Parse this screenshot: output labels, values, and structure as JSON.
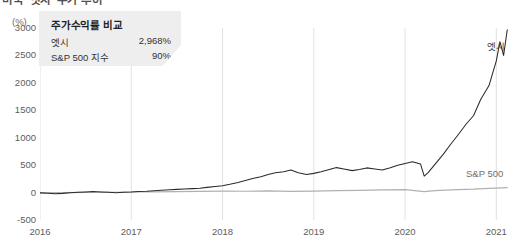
{
  "headline": "미국 ‘엣시’ 주가 추이",
  "axis_unit": "(%)",
  "callout": {
    "title": "주가수익률 비교",
    "rows": [
      {
        "name": "엣시",
        "value": "2,968%"
      },
      {
        "name": "S&P 500 지수",
        "value": "90%"
      }
    ]
  },
  "series_labels": {
    "etsy": "엣시",
    "sp500": "S&P 500"
  },
  "colors": {
    "etsy_line": "#2b2b2b",
    "sp500_line": "#b0b0b0",
    "callout_bg": "#eeeeee",
    "gridline": "#e2e2e2",
    "tick_text": "#5d5d5d"
  },
  "chart_data": {
    "type": "line",
    "title": "미국 ‘엣시’ 주가 추이",
    "subtitle": "주가수익률 비교",
    "xlabel": "",
    "ylabel": "(%)",
    "ylim": [
      -500,
      3000
    ],
    "ytick_labels": [
      "3000",
      "2500",
      "2000",
      "1500",
      "1000",
      "500",
      "0",
      "-500"
    ],
    "ytick_values": [
      3000,
      2500,
      2000,
      1500,
      1000,
      500,
      0,
      -500
    ],
    "xtick_labels": [
      "2016",
      "2017",
      "2018",
      "2019",
      "2020",
      "2021"
    ],
    "xtick_values": [
      2016,
      2017,
      2018,
      2019,
      2020,
      2021
    ],
    "xlim": [
      2016,
      2021.15
    ],
    "grid": false,
    "legend_position": "inline-right",
    "annotations": [
      {
        "text": "엣시",
        "x": 2021.0,
        "y": 2650
      },
      {
        "text": "S&P 500",
        "x": 2020.85,
        "y": 230
      }
    ],
    "series": [
      {
        "name": "엣시",
        "color": "#2b2b2b",
        "final_value": 2968,
        "x": [
          2016.0,
          2016.08,
          2016.17,
          2016.25,
          2016.33,
          2016.42,
          2016.5,
          2016.58,
          2016.67,
          2016.75,
          2016.83,
          2016.92,
          2017.0,
          2017.08,
          2017.17,
          2017.25,
          2017.33,
          2017.42,
          2017.5,
          2017.58,
          2017.67,
          2017.75,
          2017.83,
          2017.92,
          2018.0,
          2018.08,
          2018.17,
          2018.25,
          2018.33,
          2018.42,
          2018.5,
          2018.58,
          2018.67,
          2018.75,
          2018.83,
          2018.92,
          2019.0,
          2019.08,
          2019.17,
          2019.25,
          2019.33,
          2019.42,
          2019.5,
          2019.58,
          2019.67,
          2019.75,
          2019.83,
          2019.92,
          2020.0,
          2020.08,
          2020.17,
          2020.21,
          2020.25,
          2020.33,
          2020.42,
          2020.5,
          2020.58,
          2020.67,
          2020.75,
          2020.83,
          2020.92,
          2021.0,
          2021.04,
          2021.08,
          2021.12
        ],
        "values": [
          -5,
          -12,
          -20,
          -15,
          -5,
          5,
          12,
          18,
          10,
          4,
          -2,
          6,
          10,
          18,
          25,
          35,
          42,
          50,
          58,
          66,
          72,
          80,
          95,
          110,
          125,
          150,
          185,
          220,
          255,
          290,
          330,
          360,
          380,
          410,
          360,
          330,
          350,
          380,
          420,
          455,
          430,
          400,
          420,
          450,
          430,
          410,
          450,
          500,
          530,
          560,
          520,
          300,
          360,
          520,
          700,
          880,
          1050,
          1250,
          1400,
          1700,
          1950,
          2400,
          2750,
          2500,
          2968
        ]
      },
      {
        "name": "S&P 500",
        "color": "#b0b0b0",
        "final_value": 90,
        "x": [
          2016.0,
          2016.25,
          2016.5,
          2016.75,
          2017.0,
          2017.25,
          2017.5,
          2017.75,
          2018.0,
          2018.25,
          2018.5,
          2018.75,
          2019.0,
          2019.25,
          2019.5,
          2019.75,
          2020.0,
          2020.21,
          2020.33,
          2020.5,
          2020.75,
          2020.92,
          2021.12
        ],
        "values": [
          0,
          -2,
          3,
          6,
          10,
          14,
          18,
          23,
          26,
          24,
          30,
          22,
          28,
          36,
          40,
          48,
          52,
          18,
          34,
          48,
          62,
          78,
          90
        ]
      }
    ]
  }
}
